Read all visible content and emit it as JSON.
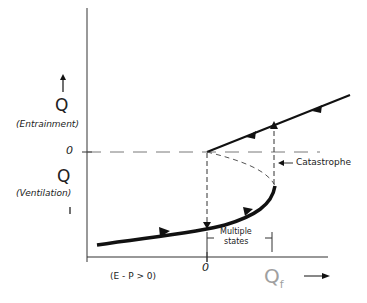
{
  "diagram": {
    "y_axis_upper_symbol": "Q",
    "y_axis_upper_label": "(Entrainment)",
    "y_axis_lower_symbol": "Q",
    "y_axis_lower_label": "(Ventilation)",
    "y_zero_label": "0",
    "x_zero_label": "0",
    "x_axis_symbol": "Q",
    "x_axis_subscript": "f",
    "condition_label": "(E - P > 0)",
    "annotation_catastrophe": "Catastrophe",
    "annotation_multiple_line1": "Multiple",
    "annotation_multiple_line2": "states",
    "colors": {
      "ink": "#111111",
      "x_axis_symbol": "#a0a0a0"
    }
  }
}
